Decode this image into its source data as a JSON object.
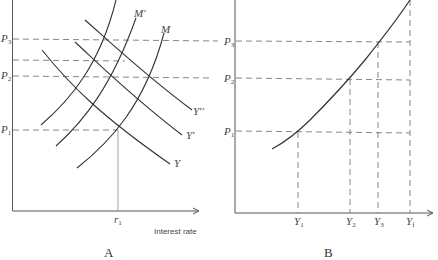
{
  "colors": {
    "curve": "#333333",
    "axis": "#555555",
    "dashed": "#777777",
    "background": "#ffffff"
  },
  "panel_a": {
    "letter": "A",
    "x_axis_title": "Interest rate",
    "y_levels": [
      {
        "name": "P3",
        "base": "P",
        "sub": "3"
      },
      {
        "name": "unlabeled",
        "base": "",
        "sub": ""
      },
      {
        "name": "P2",
        "base": "P",
        "sub": "2"
      },
      {
        "name": "P1",
        "base": "P",
        "sub": "1"
      }
    ],
    "x_tick": {
      "base": "r",
      "sub": "1"
    },
    "curves": {
      "M": "M",
      "M_prime": "M′",
      "M_double_prime": "",
      "Y": "Y",
      "Y_prime": "Y′",
      "Y_double_prime": "Y′′"
    }
  },
  "panel_b": {
    "letter": "B",
    "y_levels": [
      {
        "name": "P3",
        "base": "P",
        "sub": "3"
      },
      {
        "name": "P2",
        "base": "P",
        "sub": "2"
      },
      {
        "name": "P1",
        "base": "P",
        "sub": "1"
      }
    ],
    "x_ticks": [
      {
        "base": "Y",
        "sub": "1"
      },
      {
        "base": "Y",
        "sub": "2"
      },
      {
        "base": "Y",
        "sub": "3"
      },
      {
        "base": "Y",
        "sub": "f"
      }
    ]
  }
}
